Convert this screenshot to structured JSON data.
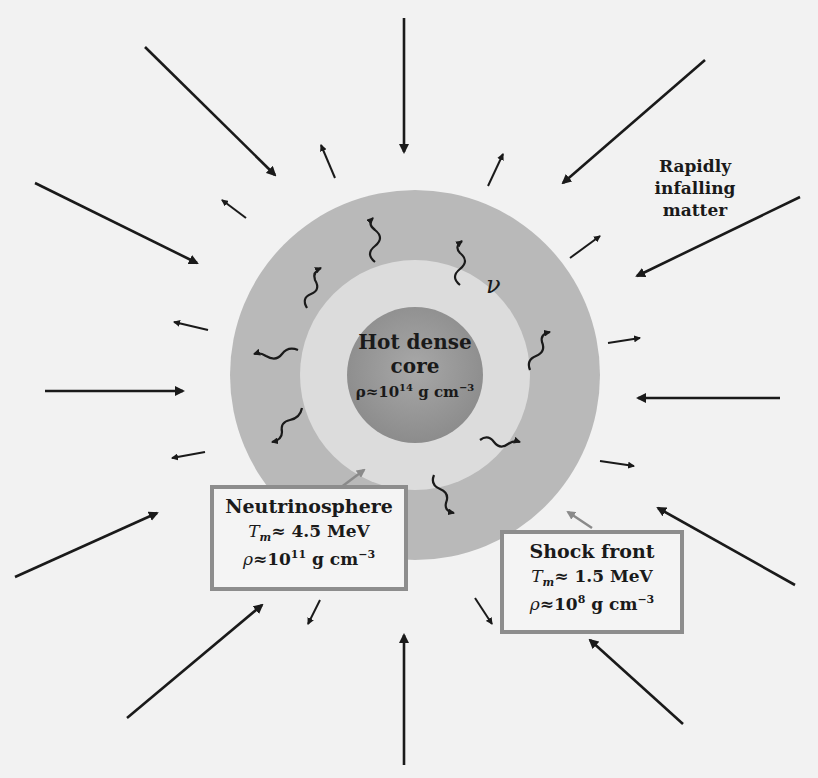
{
  "diagram": {
    "colors": {
      "background": "#f2f2f2",
      "outer_shell": "#b9b9b9",
      "neutrinosphere_zone": "#dcdcdc",
      "core": "#9a9a9a",
      "arrows": "#1a1a1a",
      "pointer_arrows": "#8a8a8a",
      "box_border": "#8d8d8d"
    },
    "core": {
      "line1": "Hot dense",
      "line2": "core",
      "density_prefix": "ρ≈10",
      "density_exp": "14",
      "density_unit": " g cm",
      "density_unit_exp": "−3"
    },
    "infalling_label": {
      "line1": "Rapidly",
      "line2": "infalling",
      "line3": "matter"
    },
    "neutrino_symbol": "ν",
    "neutrinosphere_box": {
      "title": "Neutrinosphere",
      "temp_symbol": "T",
      "temp_sub": "m",
      "temp_value": "≈  4.5 MeV",
      "density_prefix": "ρ",
      "density_value": "≈10",
      "density_exp": "11",
      "density_unit": " g cm",
      "density_unit_exp": "−3"
    },
    "shock_box": {
      "title": "Shock front",
      "temp_symbol": "T",
      "temp_sub": "m",
      "temp_value": "≈ 1.5 MeV",
      "density_prefix": "ρ",
      "density_value": "≈10",
      "density_exp": "8",
      "density_unit": " g cm",
      "density_unit_exp": "−3"
    }
  }
}
